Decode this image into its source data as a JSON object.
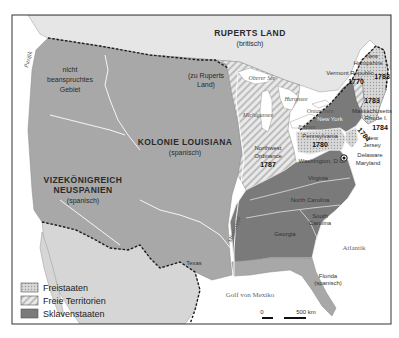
{
  "map": {
    "regions": {
      "ruperts_land": {
        "name": "RUPERTS LAND",
        "sub": "(britisch)"
      },
      "unclaimed": {
        "line1": "nicht",
        "line2": "beanspruchtes",
        "line3": "Gebiet"
      },
      "to_ruperts": {
        "line1": "(zu Ruperts",
        "line2": "Land)"
      },
      "louisiana": {
        "name": "KOLONIE LOUISIANA",
        "sub": "(spanisch)"
      },
      "new_spain": {
        "line1": "VIZEKÖNIGREICH",
        "line2": "NEUSPANIEN",
        "sub": "(spanisch)"
      },
      "northwest": {
        "line1": "Northwest",
        "line2": "Ordinance",
        "year": "1787"
      }
    },
    "states": {
      "new_hampshire": {
        "line1": "New",
        "line2": "Hampshire"
      },
      "vermont": {
        "name": "Vermont Republic",
        "year": "1770"
      },
      "maine_year": "1783",
      "mass_year": "1783",
      "massachusetts": "Massachusetts",
      "rhode_island": "Rhode I.",
      "ri_year": "1784",
      "connecticut_year": "1784",
      "new_york": "New York",
      "pennsylvania": {
        "name": "Pennsylvania",
        "year": "1780"
      },
      "new_jersey": {
        "line1": "New",
        "line2": "Jersey"
      },
      "delaware": "Delaware",
      "maryland": "Maryland",
      "washington": "Washington, D.C.",
      "virginia": "Virginia",
      "north_carolina": "North Carolina",
      "south_carolina": {
        "line1": "South",
        "line2": "Carolina"
      },
      "georgia": "Georgia",
      "florida": {
        "line1": "Florida",
        "line2": "(spanisch)"
      },
      "texas": "Texas"
    },
    "water": {
      "pacific": "Pazifik",
      "atlantic": "Atlantik",
      "gulf": "Golf von Mexiko",
      "mississippi": "Mississippi",
      "superior": "Oberer See",
      "michigan": "Michigansee",
      "huron": "Huronsee",
      "ontario": "Ontariosee",
      "erie": "Eriesee"
    },
    "scale": {
      "zero": "0",
      "max": "500 km"
    },
    "legend": [
      {
        "label": "Freistaaten",
        "pattern": "dots"
      },
      {
        "label": "Freie Territorien",
        "pattern": "stripes"
      },
      {
        "label": "Sklavenstaaten",
        "pattern": "solid"
      }
    ],
    "colors": {
      "water": "#ffffff",
      "foreign_land": "#e6e6e6",
      "claimed_land": "#a8a8a8",
      "slave_states": "#7a7a7a",
      "free_states": "#cfcfcf",
      "border_dashed": "#1a1a1a"
    }
  }
}
